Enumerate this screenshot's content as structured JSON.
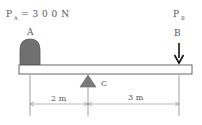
{
  "diagram": {
    "force_a": {
      "symbol": "P",
      "subscript": "A",
      "equals": "= 3 0 0 N"
    },
    "force_b": {
      "symbol": "P",
      "subscript": "B"
    },
    "point_a_label": "A",
    "point_b_label": "B",
    "pivot_label": "C",
    "dimension_left": "2 m",
    "dimension_right": "3 m",
    "colors": {
      "block_fill": "#707070",
      "pivot_fill": "#7a7a7a",
      "beam_stroke": "#555555",
      "arrow": "#111111"
    }
  }
}
